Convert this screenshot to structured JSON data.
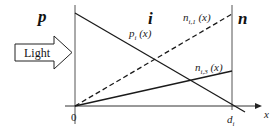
{
  "regions": {
    "p": "p",
    "i": "i",
    "n": "n"
  },
  "light_arrow": {
    "label": "Light"
  },
  "axis": {
    "origin_label": "0",
    "x_label": "x",
    "d_label_main": "d",
    "d_label_sub": "i"
  },
  "curves": {
    "p_i": {
      "main": "p",
      "sub": "i",
      "arg": " (x)",
      "style": "solid"
    },
    "n_i1": {
      "main": "n",
      "sub": "i,1",
      "arg": " (x)",
      "style": "dashed"
    },
    "n_i3": {
      "main": "n",
      "sub": "i,3",
      "arg": " (x)",
      "style": "solid"
    }
  },
  "colors": {
    "line": "#1a1a1a",
    "boundary": "#555555",
    "background": "#ffffff"
  }
}
